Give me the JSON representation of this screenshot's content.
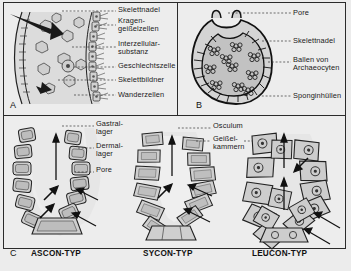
{
  "figure": {
    "background_color": "#ededed",
    "border_color": "#2b2b2b",
    "fill_gray": "#c9c9c9",
    "fill_light": "#e3e3e3"
  },
  "panels": {
    "a": {
      "letter": "A",
      "labels": [
        {
          "name": "skelettnadel",
          "text": "Skelettnadel",
          "x": 118,
          "y": 8
        },
        {
          "name": "kragengeisselzellen",
          "text": "Kragen-\ngeißelzellen",
          "x": 118,
          "y": 20
        },
        {
          "name": "interzellularsubstanz",
          "text": "Interzellular-\nsubstanz",
          "x": 118,
          "y": 42
        },
        {
          "name": "geschlechtszelle",
          "text": "Geschlechtszelle",
          "x": 118,
          "y": 64
        },
        {
          "name": "skelettbildner",
          "text": "Skelettbildner",
          "x": 118,
          "y": 78
        },
        {
          "name": "wanderzellen",
          "text": "Wanderzellen",
          "x": 118,
          "y": 93
        }
      ]
    },
    "b": {
      "letter": "B",
      "labels": [
        {
          "name": "pore",
          "text": "Pore",
          "x": 293,
          "y": 10
        },
        {
          "name": "skelettnadel",
          "text": "Skelettnadel",
          "x": 293,
          "y": 38
        },
        {
          "name": "ballen-von-archaeocyten",
          "text": "Ballen von\nArchaeocyten",
          "x": 293,
          "y": 57
        },
        {
          "name": "sponginhuellen",
          "text": "Sponginhüllen",
          "x": 293,
          "y": 93
        }
      ]
    },
    "c": {
      "letter": "C",
      "types": [
        {
          "name": "ascon-typ",
          "text": "ASCON-TYP",
          "x": 31,
          "y": 252
        },
        {
          "name": "sycon-typ",
          "text": "SYCON-TYP",
          "x": 143,
          "y": 252
        },
        {
          "name": "leucon-typ",
          "text": "LEUCON-TYP",
          "x": 252,
          "y": 252
        }
      ],
      "labels": [
        {
          "name": "gastrallager",
          "text": "Gastral-\nlager",
          "x": 96,
          "y": 121
        },
        {
          "name": "dermallager",
          "text": "Dermal-\nlager",
          "x": 96,
          "y": 144
        },
        {
          "name": "pore",
          "text": "Pore",
          "x": 96,
          "y": 168
        },
        {
          "name": "osculum",
          "text": "Osculum",
          "x": 213,
          "y": 124
        },
        {
          "name": "geisselkammern",
          "text": "Geißel-\nkammern",
          "x": 213,
          "y": 137
        }
      ]
    }
  }
}
